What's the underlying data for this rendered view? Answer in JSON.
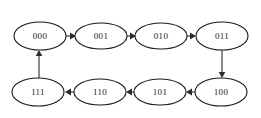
{
  "diagram": {
    "type": "state-transition-cycle",
    "background_color": "#ffffff",
    "node_fill": "#ffffff",
    "node_stroke": "#1a1a1a",
    "edge_color": "#2b2b2b",
    "nodes": [
      {
        "id": "n000",
        "label": "000",
        "cx": 40,
        "cy": 36,
        "rx": 26,
        "ry": 14,
        "row": "top"
      },
      {
        "id": "n001",
        "label": "001",
        "cx": 101,
        "cy": 36,
        "rx": 26,
        "ry": 13,
        "row": "top"
      },
      {
        "id": "n010",
        "label": "010",
        "cx": 161,
        "cy": 36,
        "rx": 26,
        "ry": 13,
        "row": "top"
      },
      {
        "id": "n011",
        "label": "011",
        "cx": 222,
        "cy": 36,
        "rx": 26,
        "ry": 14,
        "row": "top"
      },
      {
        "id": "n111",
        "label": "111",
        "cx": 38,
        "cy": 92,
        "rx": 26,
        "ry": 14,
        "row": "bottom"
      },
      {
        "id": "n110",
        "label": "110",
        "cx": 100,
        "cy": 92,
        "rx": 26,
        "ry": 13,
        "row": "bottom"
      },
      {
        "id": "n101",
        "label": "101",
        "cx": 160,
        "cy": 92,
        "rx": 26,
        "ry": 13,
        "row": "bottom"
      },
      {
        "id": "n100",
        "label": "100",
        "cx": 221,
        "cy": 92,
        "rx": 26,
        "ry": 14,
        "row": "bottom"
      }
    ],
    "edges": [
      {
        "id": "e1",
        "from": "000",
        "to": "001",
        "direction": "right"
      },
      {
        "id": "e2",
        "from": "001",
        "to": "010",
        "direction": "right"
      },
      {
        "id": "e3",
        "from": "010",
        "to": "011",
        "direction": "right"
      },
      {
        "id": "e4",
        "from": "011",
        "to": "100",
        "direction": "down"
      },
      {
        "id": "e5",
        "from": "100",
        "to": "101",
        "direction": "left"
      },
      {
        "id": "e6",
        "from": "101",
        "to": "110",
        "direction": "left"
      },
      {
        "id": "e7",
        "from": "110",
        "to": "111",
        "direction": "left"
      },
      {
        "id": "e8",
        "from": "111",
        "to": "000",
        "direction": "up"
      }
    ]
  }
}
